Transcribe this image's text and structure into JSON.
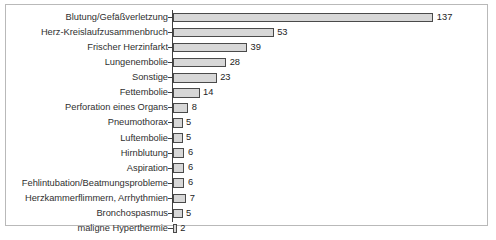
{
  "chart_data": {
    "type": "bar",
    "orientation": "horizontal",
    "title": "",
    "xlabel": "",
    "ylabel": "",
    "xlim": [
      0,
      137
    ],
    "grid": false,
    "legend": false,
    "categories": [
      "Blutung/Gefäßverletzung",
      "Herz-Kreislaufzusammenbruch",
      "Frischer Herzinfarkt",
      "Lungenembolie",
      "Sonstige",
      "Fettembolie",
      "Perforation eines Organs",
      "Pneumothorax",
      "Luftembolie",
      "Hirnblutung",
      "Aspiration",
      "Fehlintubation/Beatmungsprobleme",
      "Herzkammerflimmern, Arrhythmien",
      "Bronchospasmus",
      "maligne Hyperthermie"
    ],
    "values": [
      137,
      53,
      39,
      28,
      23,
      14,
      8,
      5,
      5,
      6,
      6,
      6,
      7,
      5,
      2
    ],
    "value_labels": [
      "137",
      "53",
      "39",
      "28",
      "23",
      "14",
      "8",
      "5",
      "5",
      "6",
      "6",
      "6",
      "7",
      "5",
      "2"
    ],
    "colors": {
      "bar_fill": "#d7d7d7",
      "bar_border": "#4a4a4a",
      "axis": "#404040",
      "frame": "#b9b9b9",
      "text": "#2f2f2f",
      "background": "#ffffff"
    },
    "pixels_per_unit": 1.9
  }
}
